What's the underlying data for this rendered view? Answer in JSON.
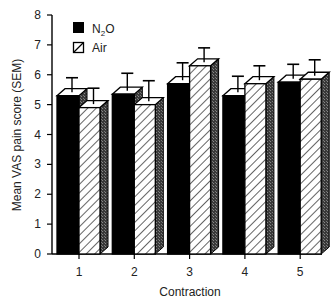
{
  "chart_data": {
    "type": "bar",
    "title": "",
    "xlabel": "Contraction",
    "ylabel": "Mean VAS pain score (SEM)",
    "categories": [
      "1",
      "2",
      "3",
      "4",
      "5"
    ],
    "series": [
      {
        "name": "N₂O",
        "pattern": "solid-black",
        "values": [
          5.3,
          5.35,
          5.7,
          5.3,
          5.75
        ],
        "sem_upper": [
          5.9,
          6.05,
          6.4,
          5.95,
          6.35
        ]
      },
      {
        "name": "Air",
        "pattern": "diagonal-hatch",
        "values": [
          4.9,
          5.0,
          6.3,
          5.7,
          5.85
        ],
        "sem_upper": [
          5.55,
          5.8,
          6.9,
          6.3,
          6.5
        ]
      }
    ],
    "ylim": [
      0,
      8
    ],
    "yticks": [
      0,
      1,
      2,
      3,
      4,
      5,
      6,
      7,
      8
    ],
    "grid": false,
    "legend_position": "upper-left-inside",
    "style": "3d-bars-with-error-bars"
  },
  "legend": {
    "items": [
      {
        "label_main": "N",
        "label_sub": "2",
        "label_tail": "O"
      },
      {
        "label_main": "Air",
        "label_sub": "",
        "label_tail": ""
      }
    ]
  },
  "axes": {
    "x_title": "Contraction",
    "y_title": "Mean VAS pain score (SEM)"
  }
}
